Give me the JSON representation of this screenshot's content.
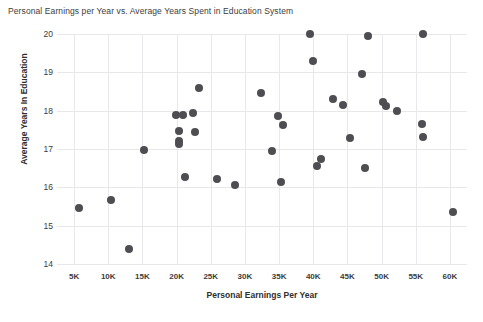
{
  "chart_data": {
    "type": "scatter",
    "title": "Personal Earnings per Year vs. Average Years Spent in Education System",
    "xlabel": "Personal Earnings Per Year",
    "ylabel": "Average Years In Education",
    "grid": true,
    "legend": "none",
    "xlim": [
      2500,
      62500
    ],
    "ylim": [
      14,
      20
    ],
    "xtick_labels": [
      "5K",
      "10K",
      "15K",
      "20K",
      "25K",
      "30K",
      "35K",
      "40K",
      "45K",
      "50K",
      "55K",
      "60K"
    ],
    "xtick_values": [
      5000,
      10000,
      15000,
      20000,
      25000,
      30000,
      35000,
      40000,
      45000,
      50000,
      55000,
      60000
    ],
    "ytick_labels": [
      "14",
      "15",
      "16",
      "17",
      "18",
      "19",
      "20"
    ],
    "ytick_values": [
      14,
      15,
      16,
      17,
      18,
      19,
      20
    ],
    "marker": {
      "shape": "circle",
      "color": "#4e4e52",
      "size_px": 8
    },
    "points": [
      {
        "x": 5700,
        "y": 15.45
      },
      {
        "x": 10400,
        "y": 15.68
      },
      {
        "x": 13000,
        "y": 14.4
      },
      {
        "x": 15200,
        "y": 16.98
      },
      {
        "x": 19900,
        "y": 17.9
      },
      {
        "x": 21000,
        "y": 17.9
      },
      {
        "x": 22400,
        "y": 17.95
      },
      {
        "x": 20300,
        "y": 17.48
      },
      {
        "x": 20300,
        "y": 17.22
      },
      {
        "x": 20300,
        "y": 17.12
      },
      {
        "x": 22700,
        "y": 17.45
      },
      {
        "x": 21300,
        "y": 16.28
      },
      {
        "x": 23300,
        "y": 18.6
      },
      {
        "x": 25900,
        "y": 16.23
      },
      {
        "x": 28500,
        "y": 16.05
      },
      {
        "x": 32400,
        "y": 18.45
      },
      {
        "x": 34900,
        "y": 17.85
      },
      {
        "x": 35600,
        "y": 17.62
      },
      {
        "x": 34000,
        "y": 16.95
      },
      {
        "x": 35300,
        "y": 16.15
      },
      {
        "x": 39500,
        "y": 20.0
      },
      {
        "x": 39900,
        "y": 19.3
      },
      {
        "x": 42900,
        "y": 18.3
      },
      {
        "x": 44400,
        "y": 18.15
      },
      {
        "x": 45400,
        "y": 17.3
      },
      {
        "x": 41200,
        "y": 16.75
      },
      {
        "x": 40500,
        "y": 16.55
      },
      {
        "x": 48000,
        "y": 19.95
      },
      {
        "x": 47200,
        "y": 18.95
      },
      {
        "x": 47500,
        "y": 16.5
      },
      {
        "x": 50200,
        "y": 18.22
      },
      {
        "x": 50700,
        "y": 18.12
      },
      {
        "x": 52200,
        "y": 18.0
      },
      {
        "x": 56000,
        "y": 20.0
      },
      {
        "x": 55900,
        "y": 17.65
      },
      {
        "x": 56100,
        "y": 17.32
      },
      {
        "x": 60500,
        "y": 15.35
      }
    ]
  }
}
